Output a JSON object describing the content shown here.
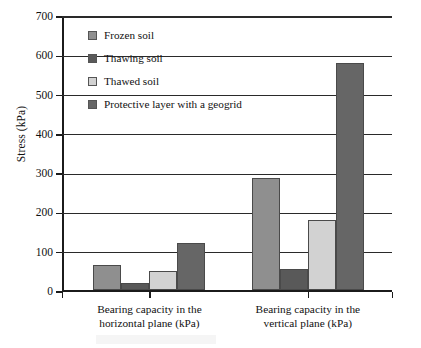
{
  "chart_data": {
    "type": "bar",
    "title": "",
    "xlabel": "",
    "ylabel": "Stress (kPa)",
    "ylim": [
      0,
      700
    ],
    "ytick_step": 100,
    "yticks": [
      0,
      100,
      200,
      300,
      400,
      500,
      600,
      700
    ],
    "ytick_labels": [
      "0",
      "100",
      "200",
      "300",
      "400",
      "500",
      "600",
      "700"
    ],
    "grid": true,
    "grid_axis": "y",
    "legend_position": "upper-left-inside",
    "categories": [
      "Bearing capacity in the horizontal plane (kPa)",
      "Bearing capacity in the vertical plane (kPa)"
    ],
    "category_lines": [
      [
        "Bearing capacity in the",
        "horizontal plane (kPa)"
      ],
      [
        "Bearing capacity in the",
        "vertical plane (kPa)"
      ]
    ],
    "series": [
      {
        "name": "Frozen soil",
        "color": "#8f8f8f",
        "values": [
          65,
          285
        ]
      },
      {
        "name": "Thawing soil",
        "color": "#595959",
        "values": [
          20,
          55
        ]
      },
      {
        "name": "Thawed soil",
        "color": "#d2d2d2",
        "values": [
          50,
          180
        ]
      },
      {
        "name": "Protective layer with a geogrid",
        "color": "#666666",
        "values": [
          120,
          580
        ]
      }
    ]
  },
  "legend": {
    "items": [
      {
        "label": "Frozen soil",
        "swatch": "#8f8f8f"
      },
      {
        "label": "Thawing soil",
        "swatch": "#595959"
      },
      {
        "label": "Thawed soil",
        "swatch": "#d2d2d2"
      },
      {
        "label": "Protective layer with a geogrid",
        "swatch": "#666666"
      }
    ]
  }
}
